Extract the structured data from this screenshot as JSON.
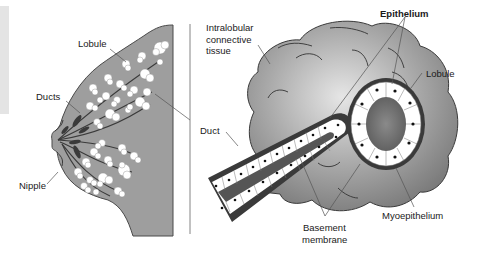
{
  "figure": {
    "left_panel": {
      "name": "breast-overview",
      "labels": {
        "lobule": "Lobule",
        "ducts": "Ducts",
        "nipple": "Nipple"
      }
    },
    "right_panel": {
      "name": "lobule-detail",
      "labels": {
        "intralobular_line1": "Intralobular",
        "intralobular_line2": "connective",
        "intralobular_line3": "tissue",
        "epithelium": "Epithelium",
        "lobule": "Lobule",
        "duct": "Duct",
        "basement_line1": "Basement",
        "basement_line2": "membrane",
        "myoepithelium": "Myoepithelium"
      }
    },
    "colors": {
      "tissue_fill": "#9a9a9a",
      "lobule_fill": "#ffffff",
      "duct_dark": "#3a3a3a",
      "connective_fill": "#8c8c8c",
      "outline": "#333333",
      "leader": "#555555"
    }
  }
}
